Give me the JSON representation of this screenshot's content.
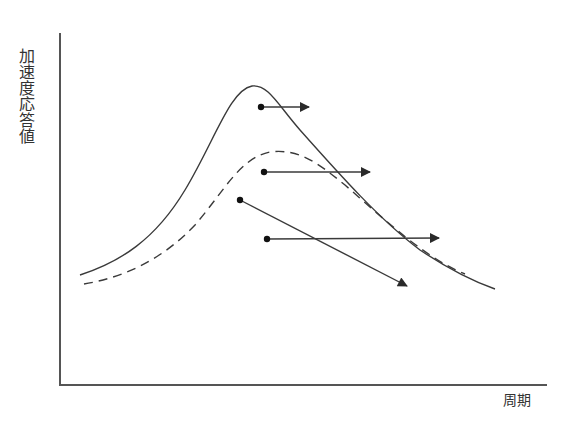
{
  "diagram": {
    "ylabel": "加速度応答値",
    "xlabel": "周期",
    "colors": {
      "line": "#3a3a3a",
      "background": "#ffffff"
    },
    "axes": {
      "origin": [
        60,
        385
      ],
      "y_top": [
        60,
        33
      ],
      "x_end": [
        547,
        385
      ]
    },
    "curves": [
      {
        "name": "solid-response-curve",
        "style": "solid",
        "path": "M80,275 C120,262 155,240 185,190 C215,140 230,90 252,86 C268,84 278,105 300,130 C340,175 380,220 420,250 C450,270 475,282 495,289"
      },
      {
        "name": "dashed-response-curve",
        "style": "dashed",
        "path": "M84,284 C120,278 160,262 195,225 C225,190 240,158 270,152 C300,148 320,165 345,185 C385,220 425,258 465,274"
      }
    ],
    "arrows": [
      {
        "name": "arrow-1",
        "from": [
          261,
          107
        ],
        "to": [
          309,
          107
        ]
      },
      {
        "name": "arrow-2",
        "from": [
          264,
          172
        ],
        "to": [
          370,
          172
        ]
      },
      {
        "name": "arrow-3",
        "from": [
          240,
          200
        ],
        "to": [
          407,
          286
        ]
      },
      {
        "name": "arrow-4",
        "from": [
          267,
          239
        ],
        "to": [
          439,
          238
        ]
      }
    ]
  }
}
